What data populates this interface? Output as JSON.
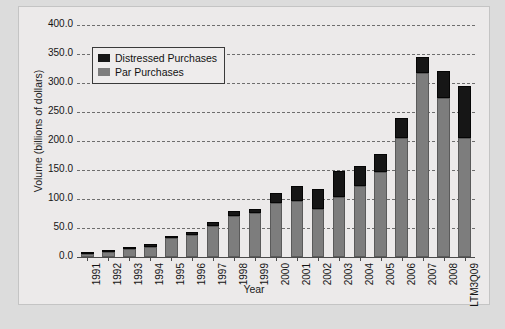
{
  "chart_data": {
    "type": "bar",
    "subtype": "stacked-bar",
    "title": "",
    "xlabel": "Year",
    "ylabel": "Volume (billions of dollars)",
    "ylim": [
      0,
      400
    ],
    "ytick_step": 50,
    "ytick_labels": [
      "400.0",
      "350.0",
      "300.0",
      "250.0",
      "200.0",
      "150.0",
      "100.0",
      "50.0",
      "0.0"
    ],
    "ytick_values": [
      400,
      350,
      300,
      250,
      200,
      150,
      100,
      50,
      0
    ],
    "grid": true,
    "grid_style": "dashed",
    "legend_position": "upper-left-inside",
    "categories": [
      "1991",
      "1992",
      "1993",
      "1994",
      "1995",
      "1996",
      "1997",
      "1998",
      "1999",
      "2000",
      "2001",
      "2002",
      "2003",
      "2004",
      "2005",
      "2006",
      "2007",
      "2008",
      "LTM3Q09"
    ],
    "series": [
      {
        "name": "Par Purchases",
        "color": "#7d7d7d",
        "values": [
          6,
          9,
          13,
          18,
          32,
          38,
          54,
          70,
          76,
          93,
          96,
          82,
          104,
          123,
          146,
          205,
          318,
          275,
          205
        ]
      },
      {
        "name": "Distressed Purchases",
        "color": "#161616",
        "values": [
          3,
          3,
          4,
          5,
          5,
          5,
          7,
          9,
          7,
          18,
          26,
          36,
          45,
          34,
          32,
          35,
          27,
          45,
          90
        ]
      }
    ],
    "totals": [
      9,
      12,
      17,
      23,
      37,
      43,
      61,
      79,
      83,
      111,
      122,
      118,
      149,
      157,
      178,
      240,
      345,
      320,
      295
    ]
  },
  "legend": {
    "items": [
      {
        "label": "Distressed Purchases",
        "color": "#161616"
      },
      {
        "label": "Par Purchases",
        "color": "#7d7d7d"
      }
    ]
  }
}
